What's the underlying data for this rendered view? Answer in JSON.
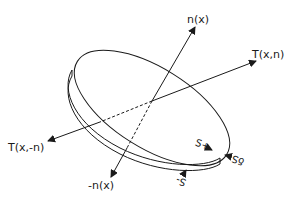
{
  "diagram": {
    "type": "cauchy-tetrahedron-disc",
    "labels": {
      "normal": "n(x)",
      "neg_normal": "-n(x)",
      "traction_pos": "T(x,n)",
      "traction_neg": "T(x,-n)",
      "s_plus": "S+",
      "s_minus": "S-",
      "delta_s": "δS"
    },
    "colors": {
      "stroke": "#1a1a1a",
      "background": "#ffffff"
    }
  }
}
